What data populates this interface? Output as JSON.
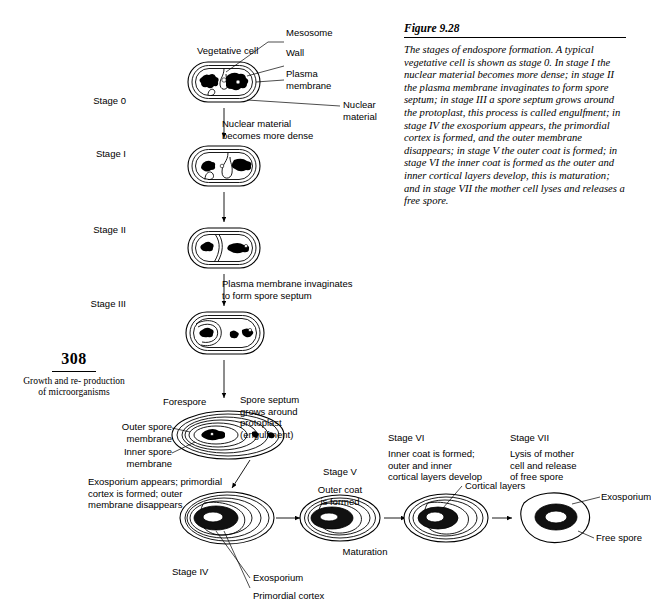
{
  "folio": {
    "page_number": "308",
    "running_head": "Growth and re-\nproduction of\nmicroorganisms"
  },
  "figure": {
    "title": "Figure 9.28",
    "caption": "The stages of endospore formation. A typical vegetative cell is shown as stage 0. In stage I the nuclear material becomes more dense; in stage II the plasma membrane invaginates to form spore septum; in stage III a spore septum grows around the protoplast, this process is called engulfment; in stage IV the exosporium appears, the primordial cortex is formed, and the outer membrane disappears; in stage V the outer coat is formed; in stage VI the inner coat is formed as the outer and inner cortical layers develop, this is maturation; and in stage VII the mother cell lyses and releases a free spore."
  },
  "stages": {
    "stage0": "Stage 0",
    "stage1": "Stage I",
    "stage2": "Stage II",
    "stage3": "Stage III",
    "stage4": "Stage IV",
    "stage5": "Stage V",
    "stage6": "Stage VI",
    "stage7": "Stage VII"
  },
  "callouts": {
    "vegetative_cell": "Vegetative cell",
    "mesosome": "Mesosome",
    "wall": "Wall",
    "plasma_membrane": "Plasma\nmembrane",
    "nuclear_material_right": "Nuclear\nmaterial",
    "forespore": "Forespore",
    "outer_spore_membrane": "Outer spore\nmembrane",
    "inner_spore_membrane": "Inner spore\nmembrane",
    "cortical_layers": "Cortical layers",
    "exosporium_right": "Exosporium",
    "free_spore": "Free spore",
    "exosporium_bottom": "Exosporium",
    "primordial_cortex_bottom": "Primordial cortex"
  },
  "transitions": {
    "t0_1": "Nuclear material\nbecomes more dense",
    "t2_3": "Plasma membrane invaginates\nto form spore septum",
    "t3_4": "Spore septum\ngrows around\nprotoplast\n(engulfment)",
    "t4_note": "Exosporium appears; primordial\ncortex is formed; outer\nmembrane disappears",
    "stage5_note": "Outer coat\nis formed",
    "stage6_note": "Inner coat is formed;\nouter and inner\ncortical layers develop",
    "stage7_note": "Lysis of mother\ncell and release\nof free spore",
    "maturation": "Maturation"
  }
}
